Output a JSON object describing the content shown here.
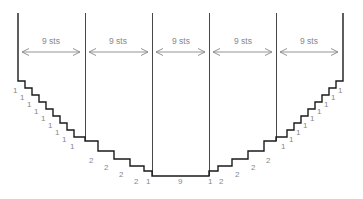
{
  "diagram": {
    "title": "",
    "colors": {
      "outline": "#1a1a1a",
      "divider": "#333333",
      "arrow": "#888888",
      "label": "#888888"
    },
    "sections": [
      {
        "label": "9 sts"
      },
      {
        "label": "9 sts"
      },
      {
        "label": "9 sts"
      },
      {
        "label": "9 sts"
      },
      {
        "label": "9 sts"
      }
    ],
    "left_step_labels": [
      "1",
      "1",
      "1",
      "1",
      "1",
      "1",
      "1",
      "1",
      "1"
    ],
    "left_lower_step_labels": [
      "2",
      "2",
      "2",
      "2",
      "1"
    ],
    "bottom_label": "9",
    "right_lower_step_labels": [
      "1",
      "2",
      "2",
      "2",
      "2"
    ],
    "right_step_labels": [
      "1",
      "1",
      "1",
      "1",
      "1",
      "1",
      "1",
      "1",
      "1"
    ]
  }
}
